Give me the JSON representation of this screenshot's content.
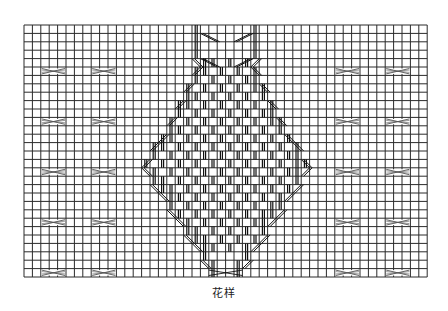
{
  "caption": "花样",
  "grid": {
    "left": 24,
    "top": 25,
    "cols": 48,
    "rows": 30,
    "cell": 8.4,
    "line_color": "#2a2a2a"
  },
  "side_crosses": {
    "rows": [
      5,
      11,
      17,
      23,
      29
    ],
    "left_cols": [
      2,
      8
    ],
    "right_cols": [
      37,
      43
    ],
    "width_cells": 3,
    "color": "#555555"
  },
  "cable": {
    "center_col": 24,
    "color": "#111111",
    "description": "Diamond-shaped cable motif with crossing stitches and vertical knit columns"
  }
}
